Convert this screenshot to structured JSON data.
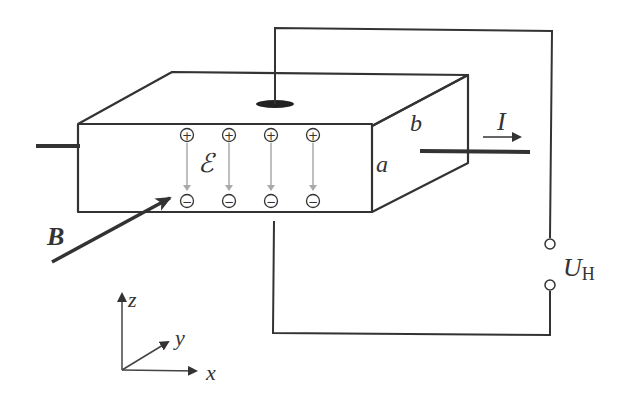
{
  "diagram": {
    "labels": {
      "magnetic_field": "B",
      "current": "I",
      "electric_field": "ℰ",
      "height": "a",
      "depth": "b",
      "hall_voltage": "U",
      "hall_voltage_subscript": "H",
      "axis_x": "x",
      "axis_y": "y",
      "axis_z": "z"
    },
    "charges": {
      "top": [
        "+",
        "+",
        "+",
        "+"
      ],
      "bottom": [
        "−",
        "−",
        "−",
        "−"
      ]
    },
    "colors": {
      "line": "#333333",
      "field_arrow": "#aaaaaa",
      "background": "#ffffff"
    }
  }
}
